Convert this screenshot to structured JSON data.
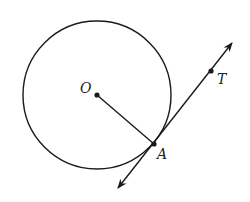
{
  "diagram": {
    "stroke_color": "#1a1a1a",
    "background": "#ffffff",
    "circle": {
      "center_label": "O",
      "cx": 97,
      "cy": 95,
      "r": 74
    },
    "points": {
      "O": {
        "label": "O",
        "x": 97,
        "y": 95,
        "label_x": 80,
        "label_y": 93
      },
      "A": {
        "label": "A",
        "x": 154,
        "y": 144,
        "label_x": 157,
        "label_y": 159
      },
      "T": {
        "label": "T",
        "x": 211,
        "y": 71,
        "label_x": 217,
        "label_y": 84
      }
    },
    "segments": [
      {
        "name": "radius-OA",
        "from": "O",
        "to": "A"
      }
    ],
    "lines": [
      {
        "name": "tangent-line-AT",
        "through": [
          "A",
          "T"
        ],
        "arrows": "both",
        "start": [
          118,
          188
        ],
        "end": [
          232,
          43
        ]
      }
    ]
  }
}
